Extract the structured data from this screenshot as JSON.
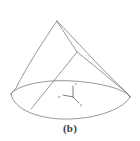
{
  "figure": {
    "caption": "(b)",
    "kind": "line-drawing",
    "line_color": "#8a8a8a",
    "axis_color": "#6e6e6e",
    "background_color": "#ffffff",
    "axes": {
      "origin_label": "",
      "x_label": "x",
      "y_label": "y",
      "z_label": "z"
    }
  }
}
